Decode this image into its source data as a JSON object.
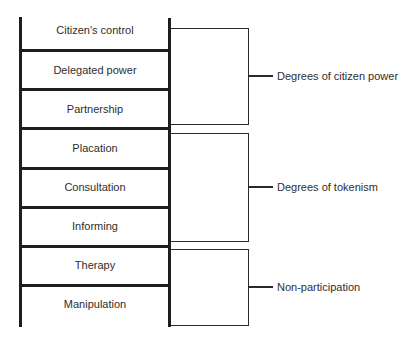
{
  "diagram": {
    "rungs": [
      {
        "label": "Citizen's control",
        "top": 18
      },
      {
        "label": "Delegated power",
        "top": 52
      },
      {
        "label": "Partnership",
        "top": 91
      },
      {
        "label": "Placation",
        "top": 130
      },
      {
        "label": "Consultation",
        "top": 170
      },
      {
        "label": "Informing",
        "top": 209
      },
      {
        "label": "Therapy",
        "top": 248
      },
      {
        "label": "Manipulation",
        "top": 287
      }
    ],
    "rung_lines_y": [
      50,
      89,
      128,
      168,
      207,
      246,
      285
    ],
    "groups": [
      {
        "label": "Degrees of citizen power",
        "top": 28,
        "bottom": 124,
        "connector_y": 76
      },
      {
        "label": "Degrees of tokenism",
        "top": 133,
        "bottom": 241,
        "connector_y": 187
      },
      {
        "label": "Non-participation",
        "top": 249,
        "bottom": 325,
        "connector_y": 287
      }
    ],
    "colors": {
      "line": "#1e1e1e",
      "text": "#2e2e2e",
      "background": "#ffffff"
    }
  }
}
